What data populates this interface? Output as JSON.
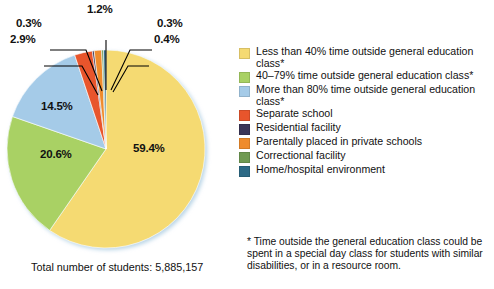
{
  "chart_data": {
    "type": "pie",
    "title": "",
    "total_label": "Total number of students: 5,885,157",
    "legend_position": "right",
    "categories": [
      "Less than 40% time outside general education class*",
      "40–79% time outside general education class*",
      "More than 80% time outside general education class*",
      "Separate school",
      "Residential facility",
      "Parentally placed in private schools",
      "Correctional facility",
      "Home/hospital environment"
    ],
    "values": [
      59.4,
      20.6,
      14.5,
      2.9,
      0.3,
      1.2,
      0.3,
      0.4
    ],
    "value_labels": [
      "59.4%",
      "20.6%",
      "14.5%",
      "2.9%",
      "0.3%",
      "1.2%",
      "0.3%",
      "0.4%"
    ],
    "colors": [
      "#f5da72",
      "#a9d164",
      "#a5cbe8",
      "#e8552c",
      "#3b3557",
      "#ef8b2c",
      "#6f9a52",
      "#2d6a86"
    ]
  },
  "pie": {
    "labels": {
      "slice1": "59.4%",
      "slice2": "20.6%",
      "slice3": "14.5%",
      "slice4": "2.9%",
      "slice5": "0.3%",
      "slice6": "1.2%",
      "slice7": "0.3%",
      "slice8": "0.4%"
    }
  },
  "legend": {
    "items": [
      {
        "label": "Less than 40% time outside general education class*",
        "color": "#f5da72"
      },
      {
        "label": "40–79% time outside general education class*",
        "color": "#a9d164"
      },
      {
        "label": "More than 80% time outside general education class*",
        "color": "#a5cbe8"
      },
      {
        "label": "Separate school",
        "color": "#e8552c"
      },
      {
        "label": "Residential facility",
        "color": "#3b3557"
      },
      {
        "label": "Parentally placed in private schools",
        "color": "#ef8b2c"
      },
      {
        "label": "Correctional facility",
        "color": "#6f9a52"
      },
      {
        "label": "Home/hospital environment",
        "color": "#2d6a86"
      }
    ]
  },
  "caption": {
    "total": "Total number of students: 5,885,157"
  },
  "footnote": {
    "text": "* Time outside the general education class could be spent in a special day class for students with similar disabilities, or in a resource room."
  }
}
